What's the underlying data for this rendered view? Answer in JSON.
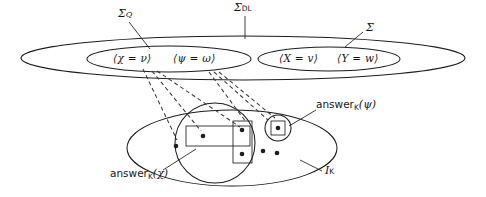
{
  "diagram": {
    "ink_color": "#1d1d1d",
    "background": "#ffffff",
    "labels": {
      "sigma_dl": "Σ",
      "sigma_dl_sub": "DL",
      "sigma_q": "Σ",
      "sigma_q_sub": "Q",
      "sigma": "Σ",
      "i_k": "I",
      "i_k_sub": "K",
      "answer_chi_name": "answer",
      "answer_chi_sub": "K",
      "answer_chi_arg": "(χ)",
      "answer_psi_name": "answer",
      "answer_psi_sub": "K",
      "answer_psi_arg": "(ψ)"
    },
    "propositions": {
      "left_ellipse": [
        "⟨χ = ν⟩",
        "⟨ψ = ω⟩"
      ],
      "right_ellipse": [
        "⟨X = v⟩",
        "⟨Y = w⟩"
      ]
    },
    "shapes": {
      "outer_ellipse": "Sigma-DL outer ellipse",
      "inner_ellipse_left": "Sigma-Q inner ellipse",
      "inner_ellipse_right": "Sigma inner ellipse",
      "bottom_ellipse": "I-K interpretation ellipse",
      "answer_chi_circle": "large circle grouping answer-K-chi",
      "answer_psi_circle": "small circle grouping answer-K-psi",
      "rect_horizontal": "horizontal answer rectangle",
      "rect_vertical": "vertical answer rectangle",
      "rect_small": "small square around single element"
    },
    "elements": {
      "dot_count_total": 8,
      "dots_in_answer_chi_circle": 4,
      "dots_outside": 3,
      "dots_in_answer_psi": 1
    }
  }
}
